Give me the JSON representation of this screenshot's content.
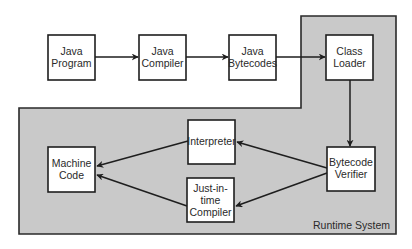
{
  "diagram": {
    "type": "flowchart",
    "region": {
      "label": "Runtime System",
      "fill": "#c9c9c9"
    },
    "nodes": {
      "java_program": {
        "lines": [
          "Java",
          "Program"
        ]
      },
      "java_compiler": {
        "lines": [
          "Java",
          "Compiler"
        ]
      },
      "java_bytecodes": {
        "lines": [
          "Java",
          "Bytecodes"
        ]
      },
      "class_loader": {
        "lines": [
          "Class",
          "Loader"
        ]
      },
      "bytecode_verifier": {
        "lines": [
          "Bytecode",
          "Verifier"
        ]
      },
      "interpreter": {
        "lines": [
          "Interpreter"
        ]
      },
      "jit_compiler": {
        "lines": [
          "Just-in-",
          "time",
          "Compiler"
        ]
      },
      "machine_code": {
        "lines": [
          "Machine",
          "Code"
        ]
      }
    },
    "edges": [
      {
        "from": "Java Program",
        "to": "Java Compiler"
      },
      {
        "from": "Java Compiler",
        "to": "Java Bytecodes"
      },
      {
        "from": "Java Bytecodes",
        "to": "Class Loader"
      },
      {
        "from": "Class Loader",
        "to": "Bytecode Verifier"
      },
      {
        "from": "Bytecode Verifier",
        "to": "Interpreter"
      },
      {
        "from": "Bytecode Verifier",
        "to": "Just-in-time Compiler"
      },
      {
        "from": "Interpreter",
        "to": "Machine Code"
      },
      {
        "from": "Just-in-time Compiler",
        "to": "Machine Code"
      }
    ]
  }
}
